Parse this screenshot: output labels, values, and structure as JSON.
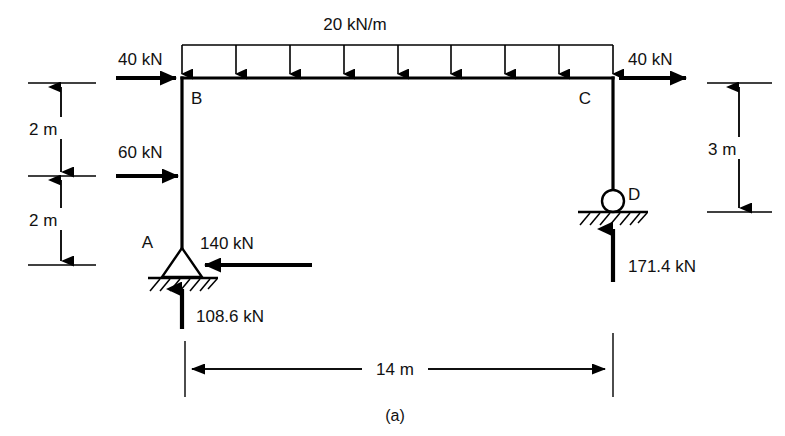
{
  "figure": {
    "caption": "(a)",
    "title_absent": true
  },
  "loads": {
    "distributed": {
      "label": "20 kN/m",
      "magnitude": 20,
      "unit": "kN/m",
      "from_node": "B",
      "to_node": "C",
      "direction": "down",
      "arrow_count": 9
    },
    "point_loads": [
      {
        "label": "40 kN",
        "magnitude": 40,
        "unit": "kN",
        "at_node": "B",
        "direction": "right"
      },
      {
        "label": "60 kN",
        "magnitude": 60,
        "unit": "kN",
        "at_node": "mid-column-AB",
        "direction": "right"
      },
      {
        "label": "40 kN",
        "magnitude": 40,
        "unit": "kN",
        "at_node": "C",
        "direction": "right"
      },
      {
        "label": "140 kN",
        "magnitude": 140,
        "unit": "kN",
        "at_node": "A",
        "direction": "left"
      }
    ],
    "reactions": [
      {
        "label": "108.6 kN",
        "magnitude": 108.6,
        "unit": "kN",
        "at_node": "A",
        "direction": "up"
      },
      {
        "label": "171.4 kN",
        "magnitude": 171.4,
        "unit": "kN",
        "at_node": "D",
        "direction": "up"
      }
    ]
  },
  "nodes": {
    "a": "A",
    "b": "B",
    "c": "C",
    "d": "D"
  },
  "supports": {
    "a": {
      "node": "A",
      "type": "pin"
    },
    "d": {
      "node": "D",
      "type": "roller"
    }
  },
  "dimensions": {
    "left_upper": "2 m",
    "left_lower": "2 m",
    "right": "3 m",
    "bottom": "14 m"
  },
  "colors": {
    "ink": "#000000",
    "paper": "#ffffff"
  }
}
